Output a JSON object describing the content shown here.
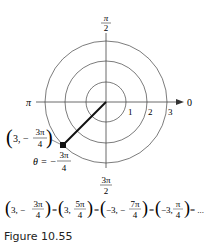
{
  "diagram": {
    "type": "polar_grid",
    "circles": [
      {
        "radius_label": "1"
      },
      {
        "radius_label": "2"
      },
      {
        "radius_label": "3"
      }
    ],
    "angle_labels": {
      "right": "0",
      "top_num": "π",
      "top_den": "2",
      "left": "π",
      "bottom_num": "3π",
      "bottom_den": "2"
    },
    "point": {
      "label_prefix": "3, −",
      "label_num": "3π",
      "label_den": "4",
      "theta_prefix": "θ = −",
      "theta_num": "3π",
      "theta_den": "4"
    },
    "equation": {
      "terms": [
        {
          "prefix": "3, −",
          "num": "3π",
          "den": "4"
        },
        {
          "prefix": "3, ",
          "num": "5π",
          "den": "4"
        },
        {
          "prefix": "−3, −",
          "num": "7π",
          "den": "4"
        },
        {
          "prefix": "−3, ",
          "num": "π",
          "den": "4"
        }
      ],
      "ellipsis": "= ..."
    }
  },
  "caption": "Figure 10.55"
}
